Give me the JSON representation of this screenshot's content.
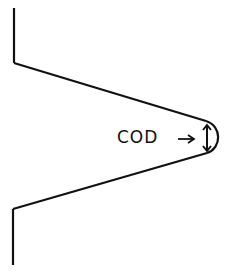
{
  "diagram": {
    "label": "COD",
    "label_arrow": "→",
    "stroke_color": "#111111",
    "background": "#ffffff"
  }
}
